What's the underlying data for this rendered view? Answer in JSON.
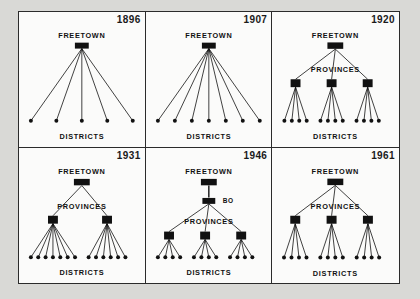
{
  "figure": {
    "title_visible": false,
    "background": "#d9d9d6",
    "panel_background": "#fbfbfa",
    "ink_color": "#111111",
    "labels": {
      "freetown": "FREETOWN",
      "provinces": "PROVINCES",
      "districts": "DISTRICTS",
      "bo": "BO"
    },
    "panels": [
      {
        "id": "panel-1896",
        "year": "1896",
        "root_label": "FREETOWN",
        "has_provinces": false,
        "has_bo": false,
        "province_count": 0,
        "district_groups": [
          5
        ],
        "district_total": 5,
        "bottom_label": "DISTRICTS"
      },
      {
        "id": "panel-1907",
        "year": "1907",
        "root_label": "FREETOWN",
        "has_provinces": false,
        "has_bo": false,
        "province_count": 0,
        "district_groups": [
          7
        ],
        "district_total": 7,
        "bottom_label": "DISTRICTS"
      },
      {
        "id": "panel-1920",
        "year": "1920",
        "root_label": "FREETOWN",
        "has_provinces": true,
        "has_bo": false,
        "province_count": 3,
        "district_groups": [
          4,
          4,
          4
        ],
        "district_total": 12,
        "bottom_label": "DISTRICTS"
      },
      {
        "id": "panel-1931",
        "year": "1931",
        "root_label": "FREETOWN",
        "has_provinces": true,
        "has_bo": false,
        "province_count": 2,
        "district_groups": [
          7,
          6
        ],
        "district_total": 13,
        "bottom_label": "DISTRICTS"
      },
      {
        "id": "panel-1946",
        "year": "1946",
        "root_label": "FREETOWN",
        "has_provinces": true,
        "has_bo": true,
        "province_count": 3,
        "district_groups": [
          4,
          4,
          4
        ],
        "district_total": 12,
        "bottom_label": "DISTRICTS"
      },
      {
        "id": "panel-1961",
        "year": "1961",
        "root_label": "FREETOWN",
        "has_provinces": true,
        "has_bo": false,
        "province_count": 3,
        "district_groups": [
          4,
          4,
          4
        ],
        "district_total": 12,
        "bottom_label": "DISTRICTS"
      }
    ]
  }
}
